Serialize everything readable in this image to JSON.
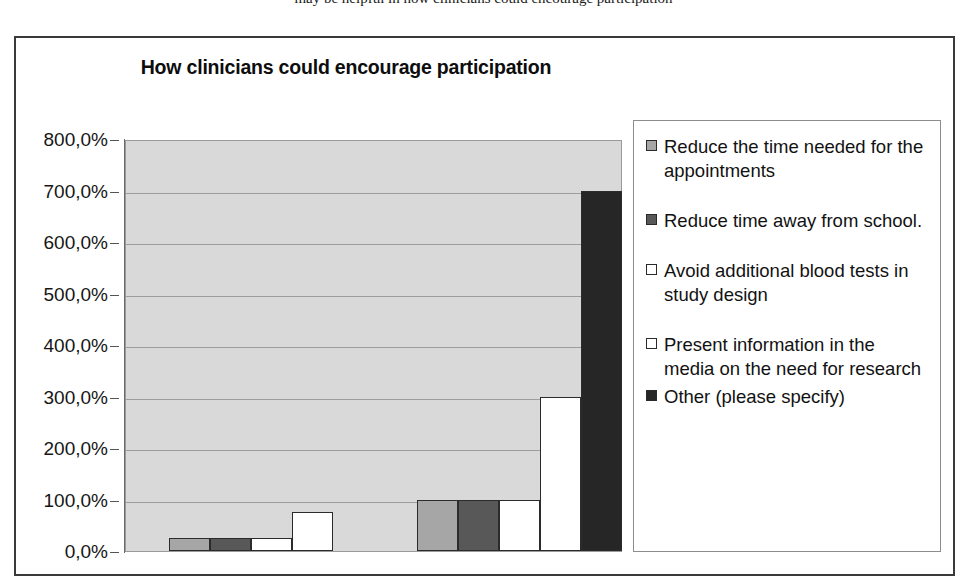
{
  "scan": {
    "top_cut_text": "may be helpful in how clinicians could encourage participation"
  },
  "chart_data": {
    "type": "bar",
    "title": "How clinicians could encourage participation",
    "xlabel": "",
    "ylabel": "",
    "ylim": [
      0,
      800
    ],
    "ytick_labels": [
      "800,0%",
      "700,0%",
      "600,0%",
      "500,0%",
      "400,0%",
      "300,0%",
      "200,0%",
      "100,0%",
      "0,0%"
    ],
    "ytick_values": [
      800,
      700,
      600,
      500,
      400,
      300,
      200,
      100,
      0
    ],
    "grid": true,
    "legend_position": "right",
    "categories": [
      "Group 1",
      "Group 2"
    ],
    "series": [
      {
        "name": "Reduce the time needed for the appointments",
        "color": "#a6a6a6",
        "values": [
          25,
          100
        ]
      },
      {
        "name": "Reduce time away from school.",
        "color": "#585858",
        "values": [
          25,
          100
        ]
      },
      {
        "name": "Avoid additional blood tests in study design",
        "color": "#ffffff",
        "values": [
          25,
          100
        ]
      },
      {
        "name": "Present information in the media on the need for research",
        "color": "#ffffff",
        "values": [
          75,
          300
        ]
      },
      {
        "name": "Other (please specify)",
        "color": "#262626",
        "values": [
          null,
          700
        ]
      }
    ],
    "legend": [
      {
        "label": "Reduce the time needed for the appointments",
        "swatch": "#a6a6a6"
      },
      {
        "label": "Reduce time away from school.",
        "swatch": "#585858"
      },
      {
        "label": "Avoid additional blood tests in study design",
        "swatch": "#ffffff"
      },
      {
        "label": "Present information in the media on the need for research",
        "swatch": "#ffffff"
      },
      {
        "label": "Other (please specify)",
        "swatch": "#262626"
      }
    ]
  }
}
